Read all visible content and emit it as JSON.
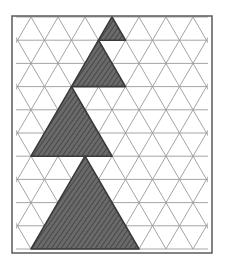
{
  "figure": {
    "colors": {
      "background": "#ffffff",
      "frame": "#5a5a5a",
      "grid": "#9a9a9a",
      "shade": "#5c5c5c",
      "shade_outline": "#3a3a3a"
    },
    "frame": {
      "x": 12,
      "y": 16,
      "width": 200,
      "height": 237
    },
    "grid": {
      "unit_side": 27,
      "row_height": 23.2,
      "top_y": 17,
      "rows": 10,
      "x_start_even": 4,
      "x_start_odd": 17.5
    },
    "shaded_triangles": [
      {
        "label": "size-1",
        "side_units": 1,
        "apex": [
          112,
          17
        ],
        "base_y": 40.2,
        "base_left": 98.5,
        "base_right": 125.5
      },
      {
        "label": "size-2",
        "side_units": 2,
        "apex": [
          98.5,
          40.2
        ],
        "base_y": 86.6,
        "base_left": 71.5,
        "base_right": 125.5
      },
      {
        "label": "size-3",
        "side_units": 3,
        "apex": [
          71.5,
          86.6
        ],
        "base_y": 156.2,
        "base_left": 31,
        "base_right": 112
      },
      {
        "label": "size-4",
        "side_units": 4,
        "apex": [
          85,
          156.2
        ],
        "base_y": 249,
        "base_left": 31,
        "base_right": 139
      }
    ]
  }
}
